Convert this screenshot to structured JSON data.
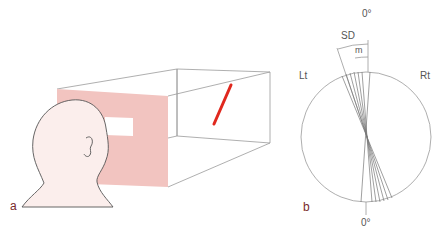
{
  "panel_a": {
    "label": "a",
    "figure": "Subject viewing a tilted red bar through a window in a pink screen, inside a box apparatus",
    "colors": {
      "screen": "#f2c4c0",
      "head": "#fbeeec",
      "bar": "#e0281e",
      "outline": "#888888"
    }
  },
  "panel_b": {
    "label": "b",
    "top_label": "0°",
    "bottom_label": "0°",
    "left_label": "Lt",
    "right_label": "Rt",
    "sd_label": "SD",
    "m_label": "m",
    "line_angles_deg": [
      -22,
      -18,
      -14,
      -10,
      -7,
      -2,
      3
    ]
  }
}
